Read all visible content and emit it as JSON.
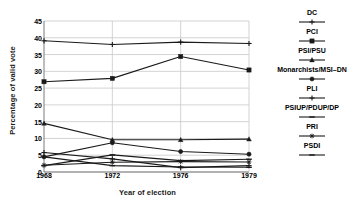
{
  "chart_data": {
    "type": "line",
    "title": "",
    "xlabel": "Year of election",
    "ylabel": "Percentage of valid vote",
    "x": [
      1968,
      1972,
      1976,
      1979
    ],
    "xticklabels": [
      "1968",
      "1972",
      "1976",
      "1979"
    ],
    "yticklabels": [
      "0",
      "5",
      "10",
      "15",
      "20",
      "25",
      "30",
      "35",
      "40",
      "45"
    ],
    "ylim": [
      0,
      45
    ],
    "ytick_step": 5,
    "grid": "horizontal",
    "legend_position": "right",
    "series": [
      {
        "name": "DC",
        "marker": "plus",
        "values": [
          39.1,
          38.0,
          38.7,
          38.3
        ]
      },
      {
        "name": "PCI",
        "marker": "square",
        "values": [
          26.9,
          27.9,
          34.4,
          30.4
        ]
      },
      {
        "name": "PSI/PSU",
        "marker": "triangle",
        "values": [
          14.5,
          9.6,
          9.6,
          9.8
        ]
      },
      {
        "name": "Monarchists/MSI–DN",
        "marker": "circle",
        "values": [
          4.5,
          8.7,
          6.1,
          5.3
        ]
      },
      {
        "name": "PLI",
        "marker": "plus",
        "values": [
          5.8,
          3.9,
          1.3,
          1.9
        ]
      },
      {
        "name": "PSIUP/PDUP/DP",
        "marker": "dash",
        "values": [
          4.5,
          1.9,
          1.5,
          1.4
        ]
      },
      {
        "name": "PRI",
        "marker": "star",
        "values": [
          2.0,
          2.9,
          3.1,
          3.0
        ]
      },
      {
        "name": "PSDI",
        "marker": "dash",
        "values": [
          1.9,
          5.1,
          3.4,
          3.8
        ]
      }
    ]
  },
  "legend": {
    "items": [
      {
        "label": "DC",
        "marker": "plus-marker"
      },
      {
        "label": "PCI",
        "marker": "square-marker"
      },
      {
        "label": "PSI/PSU",
        "marker": "triangle-marker"
      },
      {
        "label": "Monarchists/MSI–DN",
        "marker": "circle-marker"
      },
      {
        "label": "PLI",
        "marker": "plus-marker"
      },
      {
        "label": "PSIUP/PDUP/DP",
        "marker": "dash-marker"
      },
      {
        "label": "PRI",
        "marker": "star-marker"
      },
      {
        "label": "PSDI",
        "marker": "dash-marker"
      }
    ]
  },
  "colors": {
    "line": "#1a1a1a",
    "grid": "#c8c8c8",
    "axis": "#7a7a7a",
    "text": "#111111",
    "background": "#ffffff"
  }
}
